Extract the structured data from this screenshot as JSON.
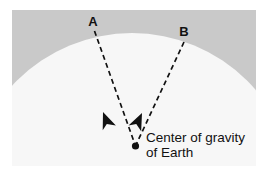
{
  "figure": {
    "title_alt": "Center of gravity of Earth diagram",
    "panel": {
      "background_color": "#c9c9c9",
      "x": 12,
      "y": 10,
      "width": 244,
      "height": 156
    },
    "earth": {
      "name": "Earth",
      "fill_color": "#f7f7f7",
      "center_x": 132,
      "center_y": 196,
      "radius": 163
    },
    "labels": [
      {
        "id": "A",
        "text": "A",
        "x": 93,
        "y": 26
      },
      {
        "id": "B",
        "text": "B",
        "x": 184,
        "y": 36
      }
    ],
    "caption": {
      "line1": "Center of gravity",
      "line2": "of Earth",
      "x": 146,
      "y1": 142,
      "y2": 157
    },
    "center_point": {
      "label": "center-of-gravity-point",
      "x": 135.5,
      "y": 146,
      "radius": 3.6,
      "color": "#111111"
    },
    "plumb_lines": [
      {
        "id": "line-A",
        "from_label": "A",
        "x1": 94.5,
        "y1": 31,
        "x2": 135.5,
        "y2": 146,
        "dash": "5,3.5",
        "color": "#111111",
        "width": 1.7
      },
      {
        "id": "line-B",
        "from_label": "B",
        "x1": 184.0,
        "y1": 42,
        "x2": 135.5,
        "y2": 146,
        "dash": "5,3.5",
        "color": "#111111",
        "width": 1.7
      }
    ],
    "arrowheads": [
      {
        "id": "arrowhead-A",
        "on_line": "line-A",
        "tip_x": 103,
        "tip_y": 112,
        "rotation_deg": 70,
        "color": "#111111"
      },
      {
        "id": "arrowhead-B",
        "on_line": "line-B",
        "tip_x": 142,
        "tip_y": 113,
        "rotation_deg": 115,
        "color": "#111111"
      }
    ]
  }
}
